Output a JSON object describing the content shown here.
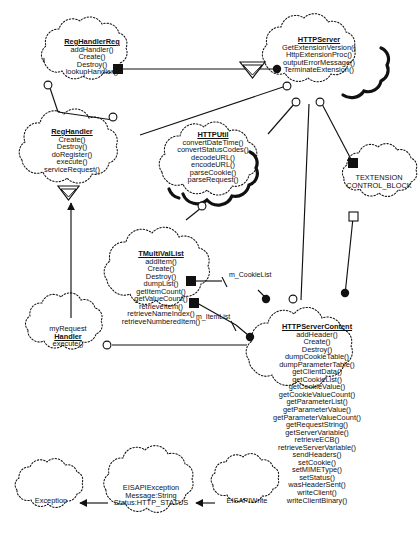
{
  "diagram": {
    "type": "uml-class-diagram",
    "title": "",
    "style": {
      "shape": "cloud",
      "line_color": "#111111",
      "background": "#ffffff"
    }
  },
  "classes": [
    {
      "id": "reghandlerreg",
      "name": "RegHandlerReg",
      "attributes": [],
      "operations": [
        "addHandler()",
        "Create()",
        "Destroy()",
        "lookupHandler()"
      ]
    },
    {
      "id": "httpserver",
      "name": "HTTPServer",
      "attributes": [],
      "operations": [
        "GetExtensionVersion()",
        "HttpExtensionProc()",
        "outputErrorMessage()",
        "TerminateExtension()"
      ]
    },
    {
      "id": "reghandler",
      "name": "RegHandler",
      "attributes": [],
      "operations": [
        "Create()",
        "Destroy()",
        "doRegister()",
        "execute()",
        "serviceRequest()"
      ]
    },
    {
      "id": "httputil",
      "name": "HTTPUtil",
      "attributes": [],
      "operations": [
        "convertDateTime()",
        "convertStatusCodes()",
        "decodeURL()",
        "encodeURL()",
        "parseCookie()",
        "parseRequest()"
      ]
    },
    {
      "id": "textension",
      "name": "TEXTENSION",
      "name_line2": "CONTROL_BLOCK",
      "attributes": [],
      "operations": []
    },
    {
      "id": "tmultivallist",
      "name": "TMultiValList",
      "attributes": [],
      "operations": [
        "addItem()",
        "Create()",
        "Destroy()",
        "dumpList()",
        "getItemCount()",
        "getValueCount()",
        "retrieveItem()",
        "retrieveNameIndex()",
        "retrieveNumberedItem()"
      ]
    },
    {
      "id": "myrequesthandler",
      "name": "myRequest",
      "name_line2": "Handler",
      "attributes": [],
      "operations": [
        "execute()"
      ]
    },
    {
      "id": "httpservercontent",
      "name": "HTTPServerContent",
      "attributes": [],
      "operations": [
        "addHeader()",
        "Create()",
        "Destroy()",
        "dumpCookieTable()",
        "dumpParameterTable()",
        "getClientData()",
        "getCookieList()",
        "getCookieValue()",
        "getCookieValueCount()",
        "getParameterList()",
        "getParameterValue()",
        "getParameterValueCount()",
        "getRequestString()",
        "getServerVariable()",
        "retrieveECB()",
        "retrieveServerVariable()",
        "sendHeaders()",
        "setCookie()",
        "setMIMEType()",
        "setStatus()",
        "wasHeaderSent()",
        "writeClient()",
        "writeClientBinary()"
      ]
    },
    {
      "id": "exception",
      "name": "Exception",
      "underline": false,
      "attributes": [],
      "operations": []
    },
    {
      "id": "eisapiexception",
      "name": "EISAPIException",
      "underline": false,
      "attributes": [
        "Message:String",
        "Status:HTTP_STATUS"
      ],
      "operations": []
    },
    {
      "id": "eisapiwrite",
      "name": "EISAPIWrite",
      "underline": false,
      "attributes": [],
      "operations": []
    }
  ],
  "connector_labels": [
    {
      "id": "m_cookielist",
      "text": "m_CookieList"
    },
    {
      "id": "m_itemlist",
      "text": "m_ItemList"
    }
  ],
  "relationships": [
    {
      "from": "httpserver",
      "to": "reghandlerreg",
      "kind": "composition",
      "marker": "filled-diamond-square"
    },
    {
      "from": "reghandlerreg",
      "to": "reghandler",
      "kind": "association",
      "marker": "hollow-circle"
    },
    {
      "from": "httpserver",
      "to": "reghandler",
      "kind": "association",
      "marker": "hollow-circle"
    },
    {
      "from": "httpserver",
      "to": "httputil",
      "kind": "association",
      "marker": "hollow-circle"
    },
    {
      "from": "httpserver",
      "to": "textension",
      "kind": "composition",
      "marker": "filled-square"
    },
    {
      "from": "httpserver",
      "to": "httpservercontent",
      "kind": "association",
      "marker": "hollow-circle"
    },
    {
      "from": "textension",
      "to": "httpservercontent",
      "kind": "aggregation",
      "marker": "hollow-square"
    },
    {
      "from": "httputil",
      "to": "tmultivallist",
      "kind": "association",
      "marker": "hollow-circle"
    },
    {
      "from": "tmultivallist",
      "to": "httpservercontent",
      "kind": "composition",
      "label": "m_CookieList",
      "marker": "filled-square"
    },
    {
      "from": "tmultivallist",
      "to": "httpservercontent",
      "kind": "composition",
      "label": "m_ItemList",
      "marker": "filled-square"
    },
    {
      "from": "myrequesthandler",
      "to": "httpservercontent",
      "kind": "association",
      "marker": "hollow-circle"
    },
    {
      "from": "myrequesthandler",
      "to": "reghandler",
      "kind": "generalization",
      "marker": "arrow"
    },
    {
      "from": "eisapiexception",
      "to": "exception",
      "kind": "generalization",
      "marker": "arrow"
    },
    {
      "from": "eisapiwrite",
      "to": "eisapiexception",
      "kind": "generalization",
      "marker": "arrow"
    }
  ]
}
